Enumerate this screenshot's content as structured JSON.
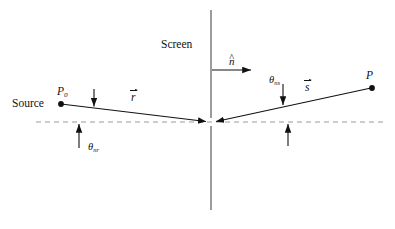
{
  "figure": {
    "background_color": "#ffffff",
    "line_color": "#111111",
    "dashed_color": "#999999",
    "width": 395,
    "height": 229
  },
  "labels": {
    "source": "Source",
    "screen": "Screen",
    "point_p0": "P",
    "point_p0_sub": "0",
    "point_p": "P",
    "vector_r": "r",
    "vector_s": "s",
    "normal_n": "n",
    "normal_hat": "^",
    "angle_nr": "θ",
    "angle_nr_sub": "nr",
    "angle_ns": "θ",
    "angle_ns_sub": "ns"
  },
  "geometry": {
    "source_point": {
      "x": 60,
      "y": 104
    },
    "aperture_vertex": {
      "x": 210,
      "y": 122
    },
    "field_point": {
      "x": 372,
      "y": 88
    },
    "screen_line": {
      "x": 211,
      "y_top": 10,
      "y_bottom": 210
    },
    "dashed_axis": {
      "y": 122,
      "x_start": 36,
      "x_end": 383
    },
    "normal_arrow": {
      "x_start": 212,
      "x_end": 253,
      "y": 70
    }
  }
}
